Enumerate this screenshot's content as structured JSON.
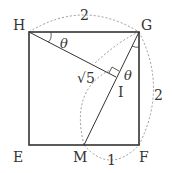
{
  "diagram": {
    "points": {
      "H": {
        "label": "H",
        "x": 29,
        "y": 32
      },
      "G": {
        "label": "G",
        "x": 139,
        "y": 32
      },
      "E": {
        "label": "E",
        "x": 29,
        "y": 145
      },
      "F": {
        "label": "F",
        "x": 139,
        "y": 145
      },
      "M": {
        "label": "M",
        "x": 84,
        "y": 145
      },
      "I": {
        "label": "I",
        "x": 116,
        "y": 77
      }
    },
    "labels": {
      "top_length": "2",
      "right_length": "2",
      "bottom_length": "1",
      "hypotenuse": "√5",
      "theta_h": "θ",
      "theta_g": "θ"
    }
  }
}
